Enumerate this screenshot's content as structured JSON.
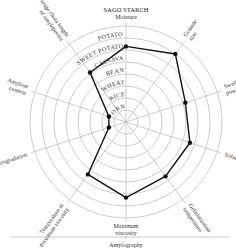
{
  "chart_data": {
    "type": "radar",
    "title": "SAGO STARCH",
    "footer_label": "Amylography",
    "center": [
      126,
      122
    ],
    "radius": 96,
    "ring_count": 8,
    "ring_labels": [
      "CORN",
      "RICE",
      "WHEAT",
      "BEAN",
      "CASSAVA",
      "SWEET POTATO",
      "POTATO"
    ],
    "axes": [
      {
        "label": "Moisture",
        "value": 6.3
      },
      {
        "label": "Granule size",
        "value": 7.0
      },
      {
        "label": "Swelling power",
        "value": 5.2
      },
      {
        "label": "Solubility",
        "value": 5.6
      },
      {
        "label": "Gelatinization temperature",
        "value": 5.6
      },
      {
        "label": "Maximum viscosity",
        "value": 6.3
      },
      {
        "label": "Temperature at maximum viscosity",
        "value": 5.4
      },
      {
        "label": "Retrogradation",
        "value": 1.5
      },
      {
        "label": "Amylose content",
        "value": 1.5
      },
      {
        "label": "Average chain length of amylopectin",
        "value": 5.1
      }
    ],
    "grid": true,
    "legend": null
  }
}
